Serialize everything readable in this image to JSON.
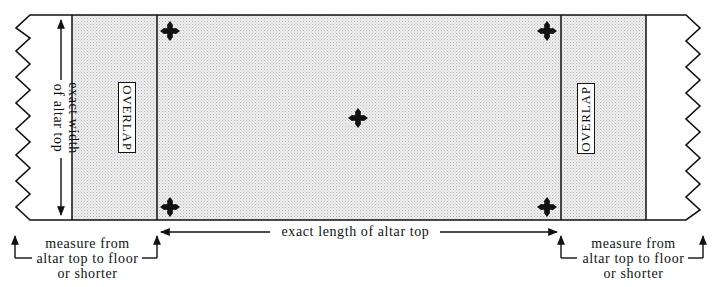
{
  "diagram": {
    "labels": {
      "width_line1": "exact width",
      "width_line2": "of altar top",
      "length": "exact length of altar top",
      "overlap_left": "OVERLAP",
      "overlap_right": "OVERLAP",
      "drop_left_line1": "measure from",
      "drop_left_line2": "altar top to floor",
      "drop_left_line3": "or shorter",
      "drop_right_line1": "measure from",
      "drop_right_line2": "altar top to floor",
      "drop_right_line3": "or shorter"
    },
    "icons": {
      "cross": "cross-pattee-icon",
      "positions": [
        "top-left",
        "top-right",
        "center",
        "bottom-left",
        "bottom-right"
      ]
    },
    "colors": {
      "line": "#111111",
      "overlap_fill": "#e4e4e4",
      "altar_fill": "#e8e8e8",
      "drop_fill": "#ffffff"
    }
  }
}
